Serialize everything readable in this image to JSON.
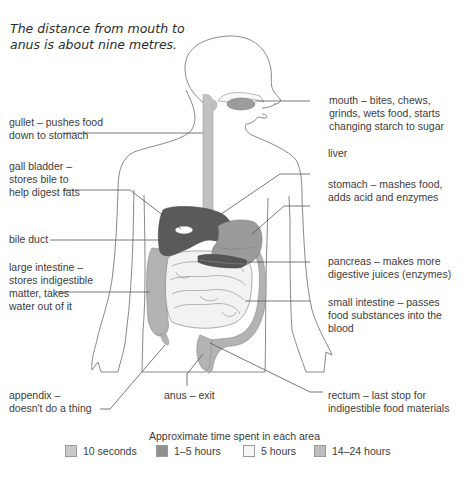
{
  "caption": {
    "line1": "The distance from mouth to",
    "line2": "anus is about nine metres."
  },
  "labels_left": {
    "gullet": [
      "gullet – pushes food",
      "down to stomach"
    ],
    "gall_bladder": [
      "gall bladder –",
      "stores bile to",
      "help digest fats"
    ],
    "bile_duct": [
      "bile duct"
    ],
    "large_intestine": [
      "large intestine –",
      "stores indigestible",
      "matter, takes",
      "water out of it"
    ],
    "appendix": [
      "appendix –",
      "doesn't do a thing"
    ]
  },
  "labels_right": {
    "mouth": [
      "mouth – bites, chews,",
      "grinds, wets food, starts",
      "changing starch to sugar"
    ],
    "liver": [
      "liver"
    ],
    "stomach": [
      "stomach – mashes food,",
      "adds acid and enzymes"
    ],
    "pancreas": [
      "pancreas – makes more",
      "digestive juices (enzymes)"
    ],
    "small_intestine": [
      "small intestine – passes",
      "food substances into the",
      "blood"
    ],
    "rectum": [
      "rectum – last stop for",
      "indigestible food materials"
    ]
  },
  "labels_bottom": {
    "anus": "anus – exit"
  },
  "legend": {
    "title": "Approximate time spent in each area",
    "items": [
      {
        "label": "10 seconds",
        "color": "#c9c9c9"
      },
      {
        "label": "1–5 hours",
        "color": "#8f8f8f"
      },
      {
        "label": "5 hours",
        "color": "#f6f6f6"
      },
      {
        "label": "14–24 hours",
        "color": "#bdbdbd"
      }
    ]
  },
  "colors": {
    "outline": "#7a7a7a",
    "leader_line": "#555555",
    "gullet_fill": "#c2c2c2",
    "liver_fill": "#5a5a5a",
    "stomach_fill": "#9a9a9a",
    "pancreas_fill": "#555555",
    "small_intestine_fill": "#f2f2f2",
    "large_intestine_fill": "#b0b0b0"
  }
}
